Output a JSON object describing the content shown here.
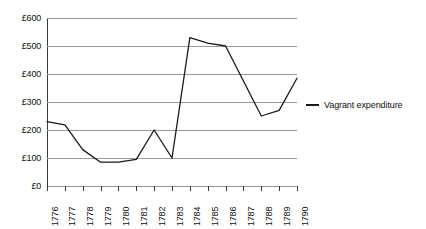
{
  "chart_data": {
    "type": "line",
    "title": "",
    "xlabel": "",
    "ylabel": "",
    "grid": true,
    "legend_position": "right",
    "ylim": [
      0,
      600
    ],
    "ytick_step": 100,
    "ytick_labels": [
      "£0",
      "£100",
      "£200",
      "£300",
      "£400",
      "£500",
      "£600"
    ],
    "ytick_values": [
      0,
      100,
      200,
      300,
      400,
      500,
      600
    ],
    "categories": [
      "1776",
      "1777",
      "1778",
      "1779",
      "1780",
      "1781",
      "1782",
      "1783",
      "1784",
      "1785",
      "1786",
      "1787",
      "1788",
      "1789",
      "1790"
    ],
    "series": [
      {
        "name": "Vagrant expenditure",
        "color": "#1a1a1a",
        "values": [
          230,
          218,
          130,
          85,
          85,
          95,
          200,
          100,
          530,
          510,
          500,
          375,
          250,
          270,
          385
        ]
      }
    ]
  },
  "legend": {
    "entries": [
      {
        "label": "Vagrant expenditure",
        "color": "#1a1a1a"
      }
    ]
  },
  "colors": {
    "series": "#1a1a1a",
    "gridline": "#9a9a9a",
    "axis": "#3a3a3a",
    "background": "#ffffff"
  }
}
